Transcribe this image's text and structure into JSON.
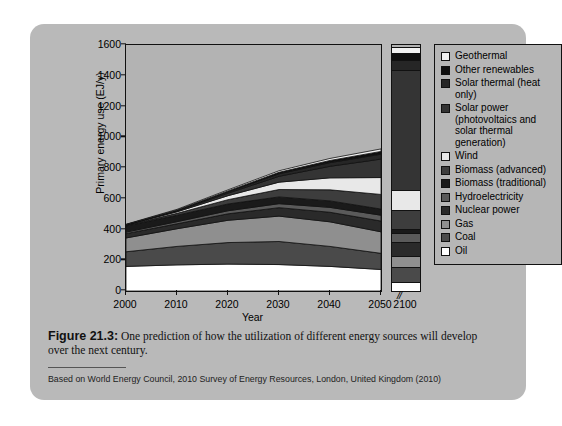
{
  "figure": {
    "caption_label": "Figure 21.3:",
    "caption_body": " One prediction of how the utilization of different energy sources will develop over the next century.",
    "source": "Based on World Energy Council, 2010 Survey of Energy Resources, London, United Kingdom (2010)"
  },
  "chart_data": {
    "type": "area",
    "title": "",
    "xlabel": "Year",
    "ylabel": "Primary energy use (EJ/y)",
    "xlim": [
      2000,
      2050
    ],
    "ylim": [
      0,
      1600
    ],
    "yticks": [
      0,
      200,
      400,
      600,
      800,
      1000,
      1200,
      1400,
      1600
    ],
    "xticks": [
      2000,
      2010,
      2020,
      2030,
      2040,
      2050
    ],
    "axis_break_symbol": "//",
    "extra_category": "2100",
    "grid": false,
    "legend_position": "right",
    "stack_order_bottom_to_top": [
      "Oil",
      "Coal",
      "Gas",
      "Nuclear power",
      "Hydroelectricity",
      "Biomass (traditional)",
      "Biomass (advanced)",
      "Wind",
      "Solar power (photovoltaics and solar thermal generation)",
      "Solar thermal (heat only)",
      "Other renewables",
      "Geothermal"
    ],
    "x": [
      2000,
      2010,
      2020,
      2030,
      2040,
      2050
    ],
    "series": [
      {
        "name": "Oil",
        "color": "#ffffff",
        "values": [
          160,
          170,
          175,
          172,
          160,
          140
        ]
      },
      {
        "name": "Coal",
        "color": "#4a4a4a",
        "values": [
          95,
          120,
          140,
          150,
          130,
          105
        ]
      },
      {
        "name": "Gas",
        "color": "#8f8f8f",
        "values": [
          90,
          115,
          145,
          165,
          160,
          140
        ]
      },
      {
        "name": "Nuclear power",
        "color": "#2a2a2a",
        "values": [
          28,
          32,
          42,
          55,
          62,
          70
        ]
      },
      {
        "name": "Hydroelectricity",
        "color": "#5a5a5a",
        "values": [
          10,
          14,
          20,
          26,
          32,
          38
        ]
      },
      {
        "name": "Biomass (traditional)",
        "color": "#1a1a1a",
        "values": [
          40,
          42,
          44,
          44,
          42,
          40
        ]
      },
      {
        "name": "Biomass (advanced)",
        "color": "#3d3d3d",
        "values": [
          4,
          12,
          28,
          48,
          72,
          95
        ]
      },
      {
        "name": "Wind",
        "color": "#e8e8e8",
        "values": [
          2,
          10,
          26,
          48,
          78,
          110
        ]
      },
      {
        "name": "Solar power (photovoltaics and solar thermal generation)",
        "color": "#343434",
        "values": [
          1,
          5,
          16,
          38,
          75,
          120
        ]
      },
      {
        "name": "Solar thermal (heat only)",
        "color": "#262626",
        "values": [
          1,
          4,
          9,
          16,
          24,
          32
        ]
      },
      {
        "name": "Other renewables",
        "color": "#101010",
        "values": [
          1,
          3,
          6,
          10,
          14,
          18
        ]
      },
      {
        "name": "Geothermal",
        "color": "#f2f2f2",
        "values": [
          2,
          4,
          7,
          10,
          13,
          16
        ]
      }
    ],
    "bar_2100": {
      "category": "2100",
      "total": 1590,
      "segments_bottom_to_top": [
        {
          "name": "Oil",
          "color": "#ffffff",
          "value": 60
        },
        {
          "name": "Coal",
          "color": "#4a4a4a",
          "value": 95
        },
        {
          "name": "Gas",
          "color": "#8f8f8f",
          "value": 70
        },
        {
          "name": "Nuclear power",
          "color": "#2a2a2a",
          "value": 95
        },
        {
          "name": "Hydroelectricity",
          "color": "#5a5a5a",
          "value": 55
        },
        {
          "name": "Biomass (traditional)",
          "color": "#1a1a1a",
          "value": 30
        },
        {
          "name": "Biomass (advanced)",
          "color": "#3d3d3d",
          "value": 120
        },
        {
          "name": "Wind",
          "color": "#e8e8e8",
          "value": 130
        },
        {
          "name": "Solar power (photovoltaics and solar thermal generation)",
          "color": "#343434",
          "value": 780
        },
        {
          "name": "Solar thermal (heat only)",
          "color": "#262626",
          "value": 70
        },
        {
          "name": "Other renewables",
          "color": "#101010",
          "value": 40
        },
        {
          "name": "Geothermal",
          "color": "#f2f2f2",
          "value": 45
        }
      ]
    },
    "legend": [
      {
        "label": "Geothermal",
        "color": "#f2f2f2"
      },
      {
        "label": "Other renewables",
        "color": "#101010"
      },
      {
        "label": "Solar thermal (heat only)",
        "color": "#262626"
      },
      {
        "label": "Solar power (photovoltaics and solar thermal generation)",
        "color": "#343434"
      },
      {
        "label": "Wind",
        "color": "#e8e8e8"
      },
      {
        "label": "Biomass (advanced)",
        "color": "#3d3d3d"
      },
      {
        "label": "Biomass (traditional)",
        "color": "#1a1a1a"
      },
      {
        "label": "Hydroelectricity",
        "color": "#5a5a5a"
      },
      {
        "label": "Nuclear power",
        "color": "#2a2a2a"
      },
      {
        "label": "Gas",
        "color": "#8f8f8f"
      },
      {
        "label": "Coal",
        "color": "#4a4a4a"
      },
      {
        "label": "Oil",
        "color": "#ffffff"
      }
    ]
  }
}
